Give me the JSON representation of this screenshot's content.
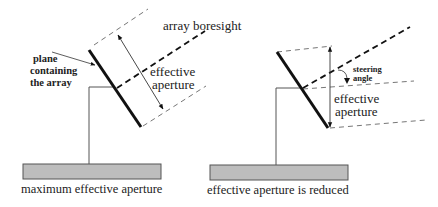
{
  "left_panel": {
    "caption": "maximum effective aperture",
    "boresight_label": "array boresight",
    "aperture_label_line1": "effective",
    "aperture_label_line2": "aperture",
    "plane_label_line1": "plane",
    "plane_label_line2": "containing",
    "plane_label_line3": "the array"
  },
  "right_panel": {
    "caption": "effective aperture is reduced",
    "steering_label_line1": "steering",
    "steering_label_line2": "angle",
    "aperture_label_line1": "effective",
    "aperture_label_line2": "aperture"
  },
  "colors": {
    "line": "#111111",
    "dashed_thin": "#666666",
    "base_fill": "#bdbdbd",
    "base_stroke": "#555555",
    "post": "#555555"
  }
}
